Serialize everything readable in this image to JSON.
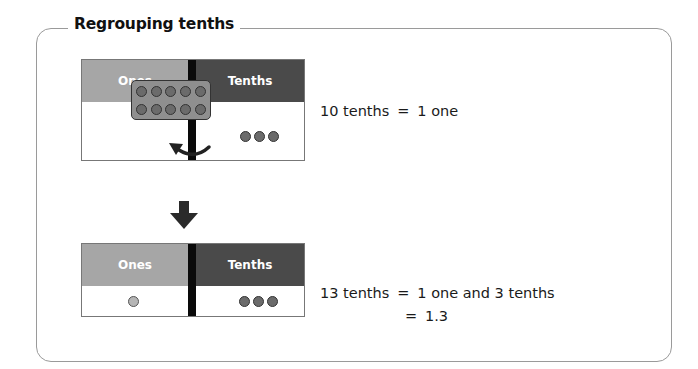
{
  "title": "Regrouping tenths",
  "top_chart": {
    "ones_label": "Ones",
    "tenths_label": "Tenths",
    "ones_count": 0,
    "grouped_tenths": 10,
    "loose_tenths": 3
  },
  "bottom_chart": {
    "ones_label": "Ones",
    "tenths_label": "Tenths",
    "ones_count": 1,
    "tenths_count": 3
  },
  "equations": {
    "eq1_left": "10 tenths",
    "eq1_sym": "=",
    "eq1_right": "1 one",
    "eq2_left": "13 tenths",
    "eq2_sym": "=",
    "eq2_right": "1 one and 3 tenths",
    "eq3_sym": "=",
    "eq3_right": "1.3"
  },
  "icons": {
    "regroup_arrow": "curved-arrow-left",
    "down_arrow": "arrow-down"
  },
  "colors": {
    "ones_header": "#a6a6a6",
    "tenths_header": "#4a4a4a",
    "divider": "#0a0a0a",
    "tenth_counter": "#6b6b6b",
    "one_counter": "#b5b5b5"
  }
}
